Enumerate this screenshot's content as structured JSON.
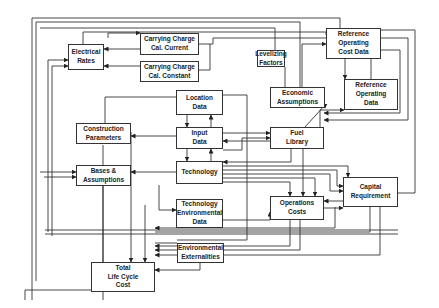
{
  "nodes": [
    {
      "id": "electrical-rates",
      "label": "Electrical\nRates"
    },
    {
      "id": "carrying-charge-current",
      "label": "Carrying Charge\nCal. Current"
    },
    {
      "id": "carrying-charge-constant",
      "label": "Carrying Charge\nCal. Constant"
    },
    {
      "id": "levelizing-factors",
      "label": "Levelizing\nFactors"
    },
    {
      "id": "reference-operating-cost-data",
      "label": "Reference\nOperating\nCost Data"
    },
    {
      "id": "location-data",
      "label": "Location\nData"
    },
    {
      "id": "economic-assumptions",
      "label": "Economic\nAssumptions"
    },
    {
      "id": "reference-operating-data",
      "label": "Reference\nOperating\nData"
    },
    {
      "id": "construction-parameters",
      "label": "Construction\nParameters"
    },
    {
      "id": "input-data",
      "label": "Input\nData"
    },
    {
      "id": "fuel-library",
      "label": "Fuel\nLibrary"
    },
    {
      "id": "bases-assumptions",
      "label": "Bases &\nAssumptions"
    },
    {
      "id": "technology",
      "label": "Technology"
    },
    {
      "id": "capital-requirement",
      "label": "Capital\nRequirement"
    },
    {
      "id": "technology-environmental-data",
      "label": "Technology\nEnvironmental\nData"
    },
    {
      "id": "operations-costs",
      "label": "Operations\nCosts"
    },
    {
      "id": "environmental-externalities",
      "label": "Environmental\nExternalities"
    },
    {
      "id": "total-life-cycle-cost",
      "label": "Total\nLife Cycle\nCost"
    }
  ],
  "edges": [
    [
      "carrying-charge-current",
      "electrical-rates"
    ],
    [
      "carrying-charge-constant",
      "electrical-rates"
    ],
    [
      "reference-operating-cost-data",
      "carrying-charge-current"
    ],
    [
      "reference-operating-cost-data",
      "carrying-charge-constant"
    ],
    [
      "economic-assumptions",
      "levelizing-factors"
    ],
    [
      "reference-operating-data",
      "reference-operating-cost-data"
    ],
    [
      "location-data",
      "input-data"
    ],
    [
      "input-data",
      "location-data"
    ],
    [
      "input-data",
      "technology"
    ],
    [
      "technology",
      "input-data"
    ],
    [
      "input-data",
      "construction-parameters"
    ],
    [
      "input-data",
      "fuel-library"
    ],
    [
      "fuel-library",
      "input-data"
    ],
    [
      "fuel-library",
      "reference-operating-data"
    ],
    [
      "fuel-library",
      "operations-costs"
    ],
    [
      "technology",
      "bases-assumptions"
    ],
    [
      "technology",
      "capital-requirement"
    ],
    [
      "capital-requirement",
      "bases-assumptions"
    ],
    [
      "operations-costs",
      "capital-requirement"
    ],
    [
      "capital-requirement",
      "operations-costs"
    ],
    [
      "input-data",
      "technology-environmental-data"
    ],
    [
      "input-data",
      "environmental-externalities"
    ],
    [
      "environmental-externalities",
      "total-life-cycle-cost"
    ],
    [
      "operations-costs",
      "total-life-cycle-cost"
    ],
    [
      "capital-requirement",
      "total-life-cycle-cost"
    ],
    [
      "construction-parameters",
      "total-life-cycle-cost"
    ],
    [
      "electrical-rates",
      "total-life-cycle-cost"
    ]
  ]
}
